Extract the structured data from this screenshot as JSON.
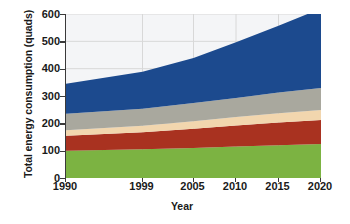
{
  "chart_data": {
    "type": "area",
    "title": "",
    "xlabel": "Year",
    "ylabel": "Total energy consumption (quads)",
    "x": [
      1990,
      1999,
      2005,
      2010,
      2015,
      2020
    ],
    "xtick_labels": [
      "1990",
      "1999",
      "2005",
      "2010",
      "2015",
      "2020"
    ],
    "ytick_labels": [
      "0",
      "100",
      "200",
      "300",
      "400",
      "500",
      "600"
    ],
    "yticks": [
      0,
      100,
      200,
      300,
      400,
      500,
      600
    ],
    "xlim": [
      1990,
      2020
    ],
    "ylim": [
      0,
      600
    ],
    "grid": true,
    "grid_axis": "both",
    "stacked": true,
    "legend": "none",
    "series": [
      {
        "name": "green-band",
        "color": "#7cb342",
        "values": [
          100,
          105,
          110,
          115,
          120,
          124
        ]
      },
      {
        "name": "red-band",
        "color": "#a93220",
        "values": [
          55,
          62,
          70,
          77,
          83,
          88
        ]
      },
      {
        "name": "tan-band",
        "color": "#f2d6ae",
        "values": [
          20,
          24,
          28,
          31,
          34,
          37
        ]
      },
      {
        "name": "gray-band",
        "color": "#a9a89e",
        "values": [
          60,
          62,
          66,
          70,
          76,
          80
        ]
      },
      {
        "name": "blue-band",
        "color": "#1c4a8e",
        "values": [
          110,
          136,
          165,
          204,
          244,
          291
        ]
      }
    ],
    "cumulative_tops": {
      "green": [
        100,
        105,
        110,
        115,
        120,
        124
      ],
      "red": [
        155,
        167,
        180,
        192,
        203,
        212
      ],
      "tan": [
        175,
        191,
        208,
        223,
        237,
        249
      ],
      "gray": [
        235,
        253,
        274,
        293,
        313,
        329
      ],
      "blue": [
        345,
        389,
        439,
        497,
        557,
        620
      ]
    },
    "totals": [
      345,
      389,
      439,
      497,
      557,
      620
    ],
    "plot_bg": "#f4f5f7",
    "grid_color": "#d8d8d8",
    "axis_color": "#3a3a3a"
  }
}
